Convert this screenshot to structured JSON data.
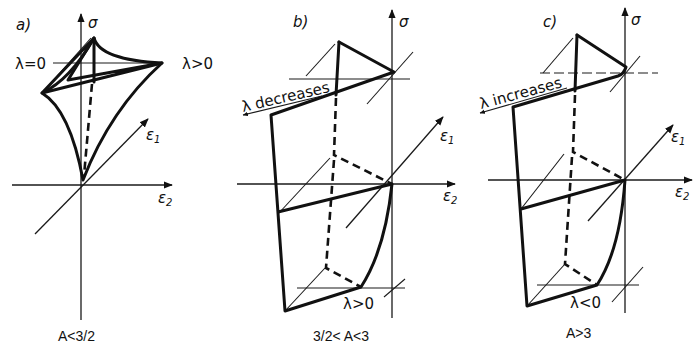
{
  "panels": [
    {
      "id": "a",
      "label": "a)",
      "sigma": "σ",
      "eps1": "ε",
      "eps1_sub": "1",
      "eps2": "ε",
      "eps2_sub": "2",
      "lambda_left": "λ=0",
      "lambda_right": "λ>0",
      "condition": "A<3/2"
    },
    {
      "id": "b",
      "label": "b)",
      "sigma": "σ",
      "eps1": "ε",
      "eps1_sub": "1",
      "eps2": "ε",
      "eps2_sub": "2",
      "lambda_trend": "λ decreases",
      "lambda_bottom": "λ>0",
      "condition": "3/2< A<3"
    },
    {
      "id": "c",
      "label": "c)",
      "sigma": "σ",
      "eps1": "ε",
      "eps1_sub": "1",
      "eps2": "ε",
      "eps2_sub": "2",
      "lambda_trend": "λ increases",
      "lambda_bottom": "λ<0",
      "condition": "A>3"
    }
  ]
}
